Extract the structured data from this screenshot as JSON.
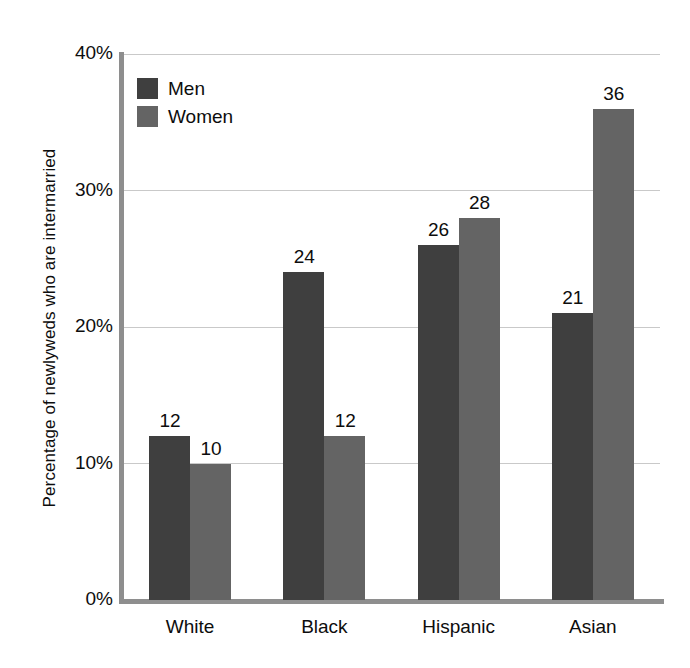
{
  "chart_data": {
    "type": "bar",
    "title": "",
    "xlabel": "",
    "ylabel": "Percentage of newlyweds who are intermarried",
    "categories": [
      "White",
      "Black",
      "Hispanic",
      "Asian"
    ],
    "series": [
      {
        "name": "Men",
        "color": "#3f3f3f",
        "values": [
          12,
          24,
          26,
          21
        ]
      },
      {
        "name": "Women",
        "color": "#646464",
        "values": [
          10,
          12,
          28,
          36
        ]
      }
    ],
    "ylim": [
      0,
      40
    ],
    "ytick_labels": [
      "0%",
      "10%",
      "20%",
      "30%",
      "40%"
    ],
    "ytick_values": [
      0,
      10,
      20,
      30,
      40
    ],
    "grid": true,
    "legend_position": "top-left",
    "value_labels_shown": true,
    "value_label_suffix": ""
  },
  "legend": {
    "items": [
      {
        "label": "Men",
        "swatch": "men-swatch"
      },
      {
        "label": "Women",
        "swatch": "women-swatch"
      }
    ]
  },
  "axis": {
    "y_title": "Percentage of newlyweds who are intermarried",
    "y_ticks": [
      "40%",
      "30%",
      "20%",
      "10%",
      "0%"
    ],
    "x_ticks": [
      "White",
      "Black",
      "Hispanic",
      "Asian"
    ]
  },
  "bars": [
    {
      "group": "White",
      "series": "Men",
      "value": "12"
    },
    {
      "group": "White",
      "series": "Women",
      "value": "10"
    },
    {
      "group": "Black",
      "series": "Men",
      "value": "24"
    },
    {
      "group": "Black",
      "series": "Women",
      "value": "12"
    },
    {
      "group": "Hispanic",
      "series": "Men",
      "value": "26"
    },
    {
      "group": "Hispanic",
      "series": "Women",
      "value": "28"
    },
    {
      "group": "Asian",
      "series": "Men",
      "value": "21"
    },
    {
      "group": "Asian",
      "series": "Women",
      "value": "36"
    }
  ],
  "colors": {
    "men": "#3f3f3f",
    "women": "#646464",
    "axis": "#8e8e8e",
    "grid": "#c9c9c9",
    "background": "#ffffff",
    "text": "#0d0d0d"
  }
}
